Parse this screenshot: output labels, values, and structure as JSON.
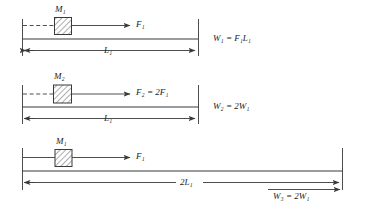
{
  "figure": {
    "type": "mechanics-work-energy-diagram",
    "stroke_color": "#3a3a3a",
    "text_color": "#1a1a1a",
    "background": "#ffffff"
  },
  "panels": [
    {
      "id": "panel-1",
      "mass_label": "M₁",
      "force_label": "F₁",
      "dimension_label": "L₁",
      "work_label": "W₁ = F₁L₁",
      "guide_line_style": "dashed"
    },
    {
      "id": "panel-2",
      "mass_label": "M₂",
      "force_label": "F₂ = 2F₁",
      "dimension_label": "L₁",
      "work_label": "W₂ = 2W₁",
      "guide_line_style": "dashed"
    },
    {
      "id": "panel-3",
      "mass_label": "M₁",
      "force_label": "F₁",
      "dimension_label": "2L₁",
      "work_label": "W₃ = 2W₁",
      "guide_line_style": "solid"
    }
  ]
}
